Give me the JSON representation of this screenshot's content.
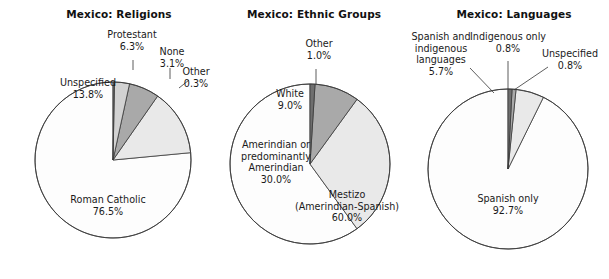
{
  "figure": {
    "background": "#ffffff",
    "width": 609,
    "height": 279,
    "outline_color": "#3a3a3a"
  },
  "palette": {
    "white_fill": "#fdfdfd",
    "light_gray": "#e9e9e9",
    "mid_gray": "#a9a9a9",
    "dark_gray": "#8f8f8f",
    "very_dark_gray": "#6f6f6f",
    "outline": "#3a3a3a",
    "text": "#1a1a1a"
  },
  "chart_data": [
    {
      "type": "pie",
      "title": "Mexico: Religions",
      "center": [
        113,
        160
      ],
      "radius": 78,
      "start_angle_deg": 0,
      "direction": "counterclockwise",
      "categories": [
        "Roman Catholic",
        "Unspecified",
        "Protestant",
        "None",
        "Other"
      ],
      "values": [
        76.5,
        13.8,
        6.3,
        3.1,
        0.3
      ],
      "value_labels": [
        "76.5%",
        "13.8%",
        "6.3%",
        "3.1%",
        "0.3%"
      ],
      "colors": [
        "#fdfdfd",
        "#e9e9e9",
        "#a9a9a9",
        "#d2d2d2",
        "#6f6f6f"
      ],
      "labels": [
        {
          "lines": [
            "Roman Catholic",
            "76.5%"
          ],
          "x": 108,
          "y": 203,
          "anchor": "middle",
          "placement": "inside",
          "leader": null
        },
        {
          "lines": [
            "Unspecified",
            "13.8%"
          ],
          "x": 88,
          "y": 86,
          "anchor": "middle",
          "placement": "inside",
          "leader": null
        },
        {
          "lines": [
            "Protestant",
            "6.3%"
          ],
          "x": 132,
          "y": 38,
          "anchor": "middle",
          "placement": "outside",
          "leader": {
            "x1": 133,
            "y1": 60,
            "x2": 133,
            "y2": 70
          }
        },
        {
          "lines": [
            "None",
            "3.1%"
          ],
          "x": 172,
          "y": 55,
          "anchor": "middle",
          "placement": "outside",
          "leader": {
            "x1": 170,
            "y1": 68,
            "x2": 170,
            "y2": 79
          }
        },
        {
          "lines": [
            "Other",
            "0.3%"
          ],
          "x": 196,
          "y": 75,
          "anchor": "middle",
          "placement": "outside",
          "leader": {
            "x1": 179,
            "y1": 88,
            "x2": 189,
            "y2": 80
          }
        }
      ]
    },
    {
      "type": "pie",
      "title": "Mexico: Ethnic Groups",
      "center": [
        310,
        164
      ],
      "radius": 80,
      "start_angle_deg": 0,
      "direction": "counterclockwise",
      "categories": [
        "Mestizo (Amerindian-Spanish)",
        "Amerindian or predominantly Amerindian",
        "White",
        "Other"
      ],
      "values": [
        60.0,
        30.0,
        9.0,
        1.0
      ],
      "value_labels": [
        "60.0%",
        "30.0%",
        "9.0%",
        "1.0%"
      ],
      "colors": [
        "#fdfdfd",
        "#e9e9e9",
        "#a9a9a9",
        "#6f6f6f"
      ],
      "labels": [
        {
          "lines": [
            "Mestizo",
            "(Amerindian-Spanish)",
            "60.0%"
          ],
          "x": 347,
          "y": 198,
          "anchor": "middle",
          "placement": "inside",
          "leader": null
        },
        {
          "lines": [
            "Amerindian or",
            "predominantly",
            "Amerindian",
            "30.0%"
          ],
          "x": 276,
          "y": 148,
          "anchor": "middle",
          "placement": "inside",
          "leader": null
        },
        {
          "lines": [
            "White",
            "9.0%"
          ],
          "x": 290,
          "y": 97,
          "anchor": "middle",
          "placement": "inside",
          "leader": null
        },
        {
          "lines": [
            "Other",
            "1.0%"
          ],
          "x": 319,
          "y": 47,
          "anchor": "middle",
          "placement": "outside",
          "leader": {
            "x1": 316,
            "y1": 69,
            "x2": 316,
            "y2": 84
          }
        }
      ]
    },
    {
      "type": "pie",
      "title": "Mexico: Languages",
      "center": [
        508,
        169
      ],
      "radius": 80,
      "start_angle_deg": 0,
      "direction": "counterclockwise",
      "categories": [
        "Spanish only",
        "Spanish and indigenous languages",
        "Indigenous only",
        "Unspecified"
      ],
      "values": [
        92.7,
        5.7,
        0.8,
        0.8
      ],
      "value_labels": [
        "92.7%",
        "5.7%",
        "0.8%",
        "0.8%"
      ],
      "colors": [
        "#fdfdfd",
        "#e9e9e9",
        "#a9a9a9",
        "#6f6f6f"
      ],
      "labels": [
        {
          "lines": [
            "Spanish only",
            "92.7%"
          ],
          "x": 508,
          "y": 202,
          "anchor": "middle",
          "placement": "inside",
          "leader": null
        },
        {
          "lines": [
            "Spanish and",
            "indigenous",
            "languages",
            "5.7%"
          ],
          "x": 441,
          "y": 40,
          "anchor": "middle",
          "placement": "outside",
          "leader": {
            "x1": 470,
            "y1": 68,
            "x2": 494,
            "y2": 93
          }
        },
        {
          "lines": [
            "Indigenous only",
            "0.8%"
          ],
          "x": 508,
          "y": 40,
          "anchor": "middle",
          "placement": "outside",
          "leader": {
            "x1": 508,
            "y1": 61,
            "x2": 508,
            "y2": 89
          }
        },
        {
          "lines": [
            "Unspecified",
            "0.8%"
          ],
          "x": 570,
          "y": 57,
          "anchor": "middle",
          "placement": "outside",
          "leader": {
            "x1": 548,
            "y1": 67,
            "x2": 514,
            "y2": 90
          }
        }
      ]
    }
  ],
  "titles": {
    "chart_1": "Mexico: Religions",
    "chart_2": "Mexico: Ethnic Groups",
    "chart_3": "Mexico: Languages"
  },
  "title_positions": [
    {
      "x": 119,
      "y": 18
    },
    {
      "x": 314,
      "y": 18
    },
    {
      "x": 514,
      "y": 18
    }
  ]
}
